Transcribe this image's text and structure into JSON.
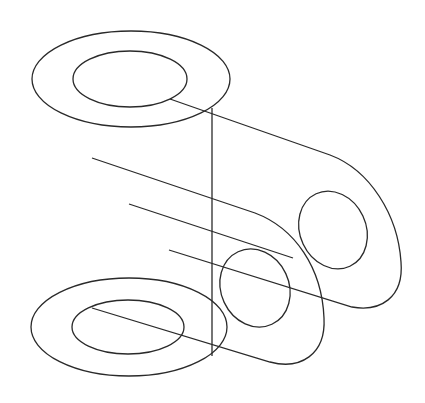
{
  "diagram": {
    "type": "isometric-line-drawing",
    "stroke_color": "#2a2a2a",
    "background": "#ffffff"
  }
}
